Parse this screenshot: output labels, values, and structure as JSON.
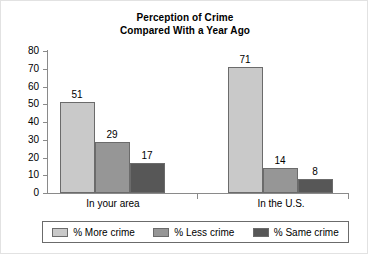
{
  "chart_data": {
    "type": "bar",
    "title": "Perception of Crime Compared With a Year Ago",
    "title_lines": [
      "Perception of Crime",
      "Compared With a Year Ago"
    ],
    "xlabel": "",
    "ylabel": "",
    "ylim": [
      0,
      80
    ],
    "yticks": [
      0,
      10,
      20,
      30,
      40,
      50,
      60,
      70,
      80
    ],
    "ytick_labels": [
      "0",
      "10",
      "20",
      "30",
      "40",
      "50",
      "60",
      "70",
      "80"
    ],
    "grid": false,
    "legend_position": "bottom",
    "categories": [
      "In your area",
      "In the U.S."
    ],
    "series": [
      {
        "name": "% More crime",
        "color": "#c9c9c9",
        "values": [
          51,
          71
        ],
        "value_labels": [
          "51",
          "71"
        ]
      },
      {
        "name": "% Less crime",
        "color": "#969696",
        "values": [
          29,
          14
        ],
        "value_labels": [
          "29",
          "14"
        ]
      },
      {
        "name": "% Same crime",
        "color": "#575757",
        "values": [
          17,
          8
        ],
        "value_labels": [
          "17",
          "8"
        ]
      }
    ]
  }
}
